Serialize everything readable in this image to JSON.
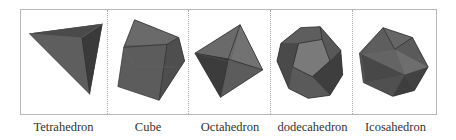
{
  "figure": {
    "panels": [
      {
        "id": "tetrahedron",
        "label": "Tetrahedron",
        "width": 87
      },
      {
        "id": "cube",
        "label": "Cube",
        "width": 82
      },
      {
        "id": "octahedron",
        "label": "Octahedron",
        "width": 82
      },
      {
        "id": "dodecahedron",
        "label": "dodecahedron",
        "width": 83
      },
      {
        "id": "icosahedron",
        "label": "Icosahedron",
        "width": 83
      }
    ],
    "colors": {
      "face_dark": "#3e3e3e",
      "face_mid": "#5a5a5a",
      "face_light": "#707070",
      "edge": "#2a2a2a",
      "frame": "#b8b8b8",
      "label": "#333333"
    }
  }
}
